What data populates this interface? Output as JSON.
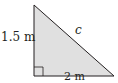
{
  "diagram": {
    "type": "right-triangle",
    "fill_color": "#e0e0e0",
    "stroke_color": "#231f20",
    "labels": {
      "vertical_leg": "1.5 m",
      "horizontal_leg": "2 m",
      "hypotenuse": "c"
    },
    "right_angle_marker": true
  }
}
